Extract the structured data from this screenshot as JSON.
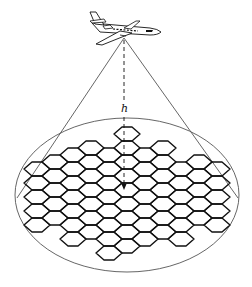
{
  "figure": {
    "type": "diagram",
    "altitude_label": "h",
    "colors": {
      "stroke": "#111111",
      "thin_stroke": "#555555",
      "background": "#ffffff"
    }
  },
  "aircraft": {
    "kind": "business-jet",
    "apex": [
      124,
      38
    ]
  },
  "footprint": {
    "shape": "ellipse",
    "cx": 127,
    "cy": 195,
    "rx": 112,
    "ry": 77
  },
  "cone_lines": [
    {
      "from": [
        124,
        38
      ],
      "to": [
        17,
        198
      ]
    },
    {
      "from": [
        124,
        38
      ],
      "to": [
        238,
        198
      ]
    }
  ],
  "altitude_line": {
    "from": [
      124,
      40
    ],
    "to": [
      124,
      190
    ],
    "dashed": true,
    "arrow": true,
    "label_pos": [
      120,
      103
    ]
  },
  "hex_grid": {
    "origin_x": 127,
    "origin_y": 134,
    "col_pitch": 18,
    "row_pitch": 14,
    "half_width": 13,
    "half_edge": 5,
    "half_height": 7,
    "cells": [
      [
        0,
        0
      ],
      [
        -3,
        1
      ],
      [
        -2,
        1
      ],
      [
        -1,
        1
      ],
      [
        1,
        1
      ],
      [
        2,
        1
      ],
      [
        -5,
        2
      ],
      [
        -4,
        2
      ],
      [
        -3,
        2
      ],
      [
        -2,
        2
      ],
      [
        -1,
        2
      ],
      [
        0,
        1
      ],
      [
        1,
        2
      ],
      [
        2,
        2
      ],
      [
        3,
        2
      ],
      [
        4,
        2
      ],
      [
        5,
        2
      ],
      [
        -5,
        3
      ],
      [
        -4,
        3
      ],
      [
        -3,
        3
      ],
      [
        -2,
        3
      ],
      [
        -1,
        3
      ],
      [
        0,
        2
      ],
      [
        0,
        3
      ],
      [
        1,
        3
      ],
      [
        2,
        3
      ],
      [
        3,
        3
      ],
      [
        4,
        3
      ],
      [
        5,
        3
      ],
      [
        -5,
        4
      ],
      [
        -4,
        4
      ],
      [
        -3,
        4
      ],
      [
        -2,
        4
      ],
      [
        -1,
        4
      ],
      [
        0,
        4
      ],
      [
        1,
        4
      ],
      [
        2,
        4
      ],
      [
        3,
        4
      ],
      [
        4,
        4
      ],
      [
        5,
        4
      ],
      [
        -5,
        5
      ],
      [
        -4,
        5
      ],
      [
        -3,
        5
      ],
      [
        -2,
        5
      ],
      [
        -1,
        5
      ],
      [
        0,
        5
      ],
      [
        1,
        5
      ],
      [
        2,
        5
      ],
      [
        3,
        5
      ],
      [
        4,
        5
      ],
      [
        5,
        5
      ],
      [
        -5,
        6
      ],
      [
        -4,
        6
      ],
      [
        -3,
        6
      ],
      [
        -2,
        6
      ],
      [
        -1,
        6
      ],
      [
        0,
        6
      ],
      [
        1,
        6
      ],
      [
        2,
        6
      ],
      [
        3,
        6
      ],
      [
        4,
        6
      ],
      [
        5,
        6
      ],
      [
        -3,
        7
      ],
      [
        -2,
        7
      ],
      [
        -1,
        7
      ],
      [
        0,
        7
      ],
      [
        1,
        7
      ],
      [
        2,
        7
      ],
      [
        3,
        7
      ],
      [
        -1,
        8
      ],
      [
        0,
        8
      ]
    ]
  }
}
